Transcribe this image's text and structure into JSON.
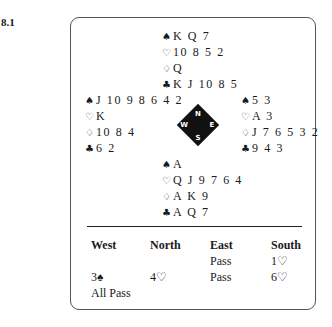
{
  "problem_number": "8.1",
  "hands": {
    "north": [
      {
        "suit": "spades",
        "symbol": "♠",
        "cards": "K Q 7"
      },
      {
        "suit": "hearts",
        "symbol": "♡",
        "cards": "10 8 5 2"
      },
      {
        "suit": "diamonds",
        "symbol": "♢",
        "cards": "Q"
      },
      {
        "suit": "clubs",
        "symbol": "♣",
        "cards": "K J 10 8 5"
      }
    ],
    "west": [
      {
        "suit": "spades",
        "symbol": "♠",
        "cards": "J 10 9 8 6 4 2"
      },
      {
        "suit": "hearts",
        "symbol": "♡",
        "cards": "K"
      },
      {
        "suit": "diamonds",
        "symbol": "♢",
        "cards": "10 8 4"
      },
      {
        "suit": "clubs",
        "symbol": "♣",
        "cards": "6 2"
      }
    ],
    "east": [
      {
        "suit": "spades",
        "symbol": "♠",
        "cards": "5 3"
      },
      {
        "suit": "hearts",
        "symbol": "♡",
        "cards": "A 3"
      },
      {
        "suit": "diamonds",
        "symbol": "♢",
        "cards": "J 7 6 5 3 2"
      },
      {
        "suit": "clubs",
        "symbol": "♣",
        "cards": "9 4 3"
      }
    ],
    "south": [
      {
        "suit": "spades",
        "symbol": "♠",
        "cards": "A"
      },
      {
        "suit": "hearts",
        "symbol": "♡",
        "cards": "Q J 9 7 6 4"
      },
      {
        "suit": "diamonds",
        "symbol": "♢",
        "cards": "A K 9"
      },
      {
        "suit": "clubs",
        "symbol": "♣",
        "cards": "A Q 7"
      }
    ]
  },
  "compass": {
    "n": "N",
    "e": "E",
    "s": "S",
    "w": "W"
  },
  "bidding": {
    "headers": [
      "West",
      "North",
      "East",
      "South"
    ],
    "rows": [
      [
        "",
        "",
        "Pass",
        "1♡"
      ],
      [
        "3♠",
        "4♡",
        "Pass",
        "6♡"
      ],
      [
        "All Pass",
        "",
        "",
        ""
      ]
    ]
  }
}
